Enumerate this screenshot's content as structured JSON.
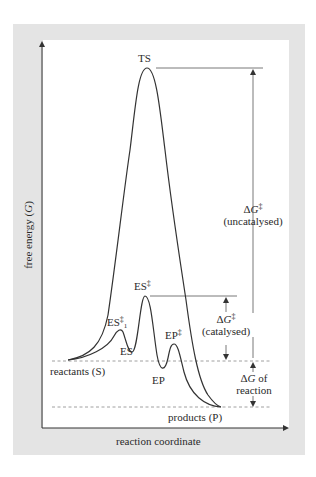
{
  "diagram": {
    "type": "reaction energy profile",
    "axes": {
      "y_label_prefix": "free energy (",
      "y_label_var": "G",
      "y_label_suffix": ")",
      "x_label": "reaction coordinate"
    },
    "points": {
      "ts": "TS",
      "es_dagger": "ES",
      "es_dagger_1": "ES",
      "es_dagger_1_sub": "1",
      "es": "ES",
      "ep_dagger": "EP",
      "ep": "EP",
      "reactants": "reactants (S)",
      "products": "products (P)",
      "dagger": "‡"
    },
    "annotations": {
      "uncat_delta": "Δ",
      "uncat_var": "G",
      "uncat_label": "(uncatalysed)",
      "cat_delta": "Δ",
      "cat_var": "G",
      "cat_label": "(catalysed)",
      "rxn_delta": "Δ",
      "rxn_var": "G",
      "rxn_of": " of",
      "rxn_label": "reaction"
    },
    "colors": {
      "panel": "#e4e4e4",
      "plot_bg": "#ffffff",
      "line": "#333333",
      "dashed": "#888888"
    }
  }
}
